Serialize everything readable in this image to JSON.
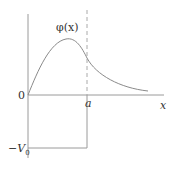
{
  "diagram": {
    "labels": {
      "origin": "0",
      "well_edge": "a",
      "x_axis": "x",
      "well_depth": "−V",
      "well_depth_sub": "0",
      "function": "φ(x)"
    },
    "colors": {
      "axis": "#9a9a9a",
      "curve": "#8a8a8a",
      "dashed": "#aaaaaa",
      "text": "#333333"
    }
  }
}
